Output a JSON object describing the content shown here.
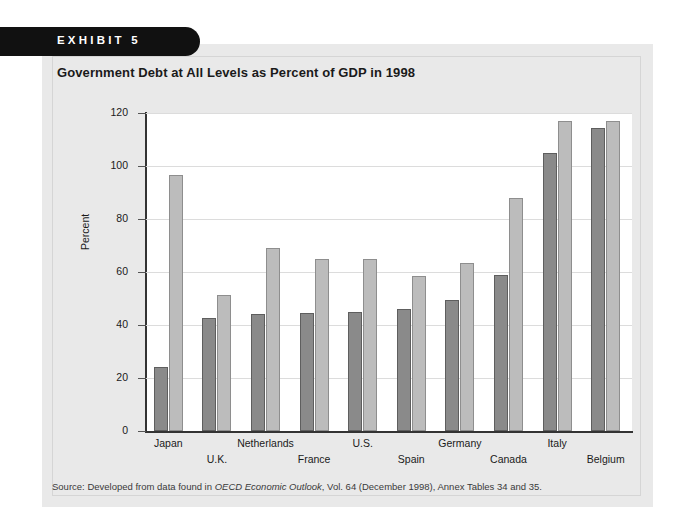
{
  "exhibit": {
    "tab_label": "EXHIBIT 5",
    "title": "Government Debt at All Levels as Percent of GDP in 1998",
    "source_prefix": "Source: Developed from data found in ",
    "source_italic": "OECD Economic Outlook",
    "source_suffix": ", Vol. 64 (December 1998), Annex Tables 34 and 35."
  },
  "legend": {
    "position": "top-center-inside",
    "items": [
      {
        "label": "Net Debt",
        "color": "#8a8a8a",
        "icon": "square-swatch-icon"
      },
      {
        "label": "Gross Debt",
        "color": "#bcbcbc",
        "icon": "square-swatch-icon"
      }
    ]
  },
  "chart_data": {
    "type": "bar",
    "title": "Government Debt at All Levels as Percent of GDP in 1998",
    "xlabel": "",
    "ylabel": "Percent",
    "ylim": [
      0,
      120
    ],
    "yticks": [
      0,
      20,
      40,
      60,
      80,
      100,
      120
    ],
    "ytick_labels": [
      "0",
      "20",
      "40",
      "60",
      "80",
      "100",
      "120"
    ],
    "grid": true,
    "grid_axis": "y",
    "legend": [
      "Net Debt",
      "Gross Debt"
    ],
    "categories": [
      "Japan",
      "U.K.",
      "Netherlands",
      "France",
      "U.S.",
      "Spain",
      "Germany",
      "Canada",
      "Italy",
      "Belgium"
    ],
    "series": [
      {
        "name": "Net Debt",
        "color": "#8a8a8a",
        "values": [
          24,
          42.5,
          44,
          44.5,
          45,
          46,
          49.5,
          59,
          105,
          114.5
        ]
      },
      {
        "name": "Gross Debt",
        "color": "#bcbcbc",
        "values": [
          96.5,
          51.5,
          69,
          65,
          65,
          58.5,
          63.5,
          88,
          117,
          117
        ]
      }
    ]
  }
}
